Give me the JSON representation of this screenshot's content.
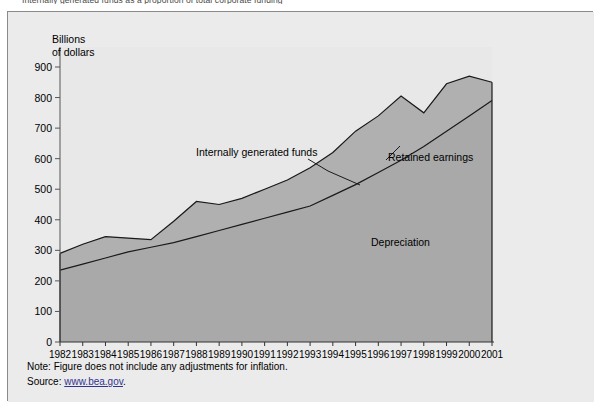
{
  "top_caption": "Internally generated funds as a proportion of total corporate funding",
  "figure": {
    "axis_title_line1": "Billions",
    "axis_title_line2": "of dollars",
    "annotations": {
      "internally_generated_funds": "Internally generated funds",
      "retained_earnings": "Retained earnings",
      "depreciation": "Depreciation"
    },
    "note_label": "Note:",
    "note_text": "Figure does not include any adjustments for inflation.",
    "source_label": "Source:",
    "source_link": "www.bea.gov",
    "source_period": "."
  },
  "colors": {
    "figure_background": "#ebebeb",
    "plot_background": "#e8e8e8",
    "area_fill": "#a9a9a9",
    "line": "#1a1a1a",
    "frame_border": "#8a8a8a",
    "link": "#33338f"
  },
  "chart_data": {
    "type": "area",
    "title": "",
    "subtitle": "",
    "xlabel": "",
    "ylabel": "Billions of dollars",
    "ylim": [
      0,
      900
    ],
    "yticks": [
      0,
      100,
      200,
      300,
      400,
      500,
      600,
      700,
      800,
      900
    ],
    "ytick_labels": [
      "0",
      "100",
      "200",
      "300",
      "400",
      "500",
      "600",
      "700",
      "800",
      "900"
    ],
    "grid": false,
    "legend": "in-plot annotations",
    "stacked": false,
    "x": [
      1982,
      1983,
      1984,
      1985,
      1986,
      1987,
      1988,
      1989,
      1990,
      1991,
      1992,
      1993,
      1994,
      1995,
      1996,
      1997,
      1998,
      1999,
      2000,
      2001
    ],
    "xtick_labels": [
      "1982",
      "1983",
      "1984",
      "1985",
      "1986",
      "1987",
      "1988",
      "1989",
      "1990",
      "1991",
      "1992",
      "1993",
      "1994",
      "1995",
      "1996",
      "1997",
      "1998",
      "1999",
      "2000",
      "2001"
    ],
    "series": [
      {
        "name": "Internally generated funds",
        "description": "Upper boundary: total internally generated funds (depreciation + retained earnings)",
        "values": [
          290,
          320,
          345,
          340,
          335,
          395,
          460,
          450,
          470,
          500,
          530,
          570,
          620,
          690,
          740,
          805,
          750,
          845,
          870,
          850
        ]
      },
      {
        "name": "Depreciation",
        "description": "Lower boundary: depreciation component, shaded region below",
        "values": [
          235,
          255,
          275,
          295,
          310,
          325,
          345,
          365,
          385,
          405,
          425,
          445,
          480,
          515,
          555,
          595,
          640,
          690,
          740,
          790
        ]
      },
      {
        "name": "Retained earnings",
        "description": "Band between the depreciation line and the internally generated funds line",
        "values": [
          55,
          65,
          70,
          45,
          25,
          70,
          115,
          85,
          85,
          95,
          105,
          125,
          140,
          175,
          185,
          210,
          110,
          155,
          130,
          60
        ]
      }
    ]
  }
}
